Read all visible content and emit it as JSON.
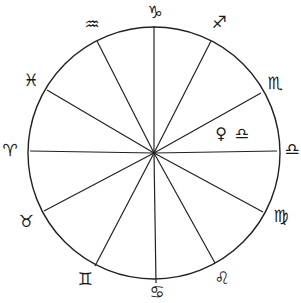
{
  "diagram": {
    "type": "zodiac-wheel",
    "center": [
      154,
      153
    ],
    "radius": 126,
    "stroke_color": "#222222",
    "background": "#ffffff",
    "divider_endpoints": [
      [
        154,
        26
      ],
      [
        211,
        41
      ],
      [
        261,
        93
      ],
      [
        277,
        151
      ],
      [
        263,
        212
      ],
      [
        215,
        263
      ],
      [
        156,
        283
      ],
      [
        95,
        266
      ],
      [
        44,
        211
      ],
      [
        30,
        151
      ],
      [
        47,
        90
      ],
      [
        97,
        41
      ]
    ],
    "signs": [
      {
        "name": "capricorn",
        "symbol": "♑",
        "pos": [
          155,
          12
        ]
      },
      {
        "name": "sagittarius",
        "symbol": "♐",
        "pos": [
          219,
          22
        ]
      },
      {
        "name": "scorpio",
        "symbol": "♏",
        "pos": [
          275,
          83
        ]
      },
      {
        "name": "libra",
        "symbol": "♎",
        "pos": [
          292,
          149
        ]
      },
      {
        "name": "virgo",
        "symbol": "♍",
        "pos": [
          281,
          216
        ]
      },
      {
        "name": "leo",
        "symbol": "♌",
        "pos": [
          222,
          278
        ]
      },
      {
        "name": "cancer",
        "symbol": "♋",
        "pos": [
          157,
          292
        ]
      },
      {
        "name": "gemini",
        "symbol": "♊",
        "pos": [
          85,
          279
        ]
      },
      {
        "name": "taurus",
        "symbol": "♉",
        "pos": [
          26,
          221
        ]
      },
      {
        "name": "aries",
        "symbol": "♈",
        "pos": [
          10,
          150
        ]
      },
      {
        "name": "pisces",
        "symbol": "♓",
        "pos": [
          31,
          80
        ]
      },
      {
        "name": "aquarius",
        "symbol": "♒",
        "pos": [
          92,
          24
        ]
      }
    ],
    "planet_annotation": {
      "planet": "venus",
      "planet_symbol": "♀",
      "planet_pos": [
        221,
        134
      ],
      "sign": "libra",
      "sign_symbol": "♎",
      "sign_pos": [
        242,
        134
      ]
    }
  }
}
